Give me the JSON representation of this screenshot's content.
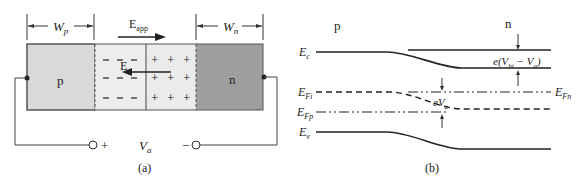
{
  "panel_a": {
    "caption": "(a)",
    "wp_label": "W",
    "wp_sub": "p",
    "wn_label": "W",
    "wn_sub": "n",
    "eapp_label": "E",
    "eapp_sub": "app",
    "e_label": "E",
    "p_label": "p",
    "n_label": "n",
    "minus": "−",
    "plus": "+",
    "va_label": "V",
    "va_sub": "a",
    "terminal_plus": "+",
    "terminal_minus": "−",
    "colors": {
      "p_region": "#d9d9d9",
      "depletion": "#ececec",
      "n_region": "#9e9e9e"
    }
  },
  "panel_b": {
    "caption": "(b)",
    "p_label": "p",
    "n_label": "n",
    "ec_label": "E",
    "ec_sub": "c",
    "efi_label": "E",
    "efi_sub": "Fi",
    "efp_label": "E",
    "efp_sub": "Fp",
    "ev_label": "E",
    "ev_sub": "v",
    "efn_label": "E",
    "efn_sub": "Fn",
    "barrier_label_pre": "e(V",
    "barrier_sub1": "bi",
    "barrier_mid": " − V",
    "barrier_sub2": "a",
    "barrier_post": ")",
    "eva_label": "eV",
    "eva_sub": "a"
  }
}
